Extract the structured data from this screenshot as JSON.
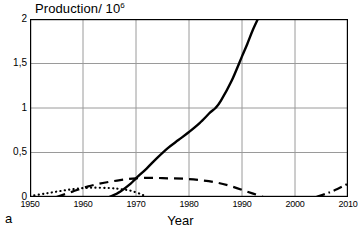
{
  "figure": {
    "panel_label": "a",
    "title": "Production/ 10",
    "title_superscript": "6",
    "xlabel": "Year"
  },
  "chart_data": {
    "type": "line",
    "xlabel": "Year",
    "ylabel": "Production/ 10^6",
    "xlim": [
      1950,
      2010
    ],
    "ylim": [
      0,
      2
    ],
    "grid": true,
    "legend": "none",
    "xticks": [
      1950,
      1960,
      1970,
      1980,
      1990,
      2000,
      2010
    ],
    "xtick_labels": [
      "1950",
      "1960",
      "1970",
      "1980",
      "1990",
      "2000",
      "2010"
    ],
    "yticks": [
      0,
      0.5,
      1,
      1.5,
      2
    ],
    "ytick_labels": [
      "0",
      "0,5",
      "1",
      "1,5",
      "2"
    ],
    "series": [
      {
        "name": "solid-curve",
        "style": "solid",
        "color": "#000000",
        "x": [
          1965,
          1967,
          1969,
          1970,
          1972,
          1974,
          1976,
          1978,
          1980,
          1982,
          1984,
          1985,
          1986,
          1988,
          1990,
          1991,
          1992,
          1993
        ],
        "values": [
          0.0,
          0.06,
          0.15,
          0.21,
          0.32,
          0.44,
          0.55,
          0.64,
          0.73,
          0.83,
          0.95,
          1.0,
          1.08,
          1.3,
          1.58,
          1.72,
          1.87,
          2.0
        ]
      },
      {
        "name": "dashed-curve",
        "style": "dashed",
        "color": "#000000",
        "x": [
          1955,
          1958,
          1961,
          1964,
          1967,
          1970,
          1973,
          1976,
          1979,
          1982,
          1985,
          1988,
          1991,
          1994
        ],
        "values": [
          0.0,
          0.06,
          0.12,
          0.16,
          0.19,
          0.21,
          0.215,
          0.21,
          0.205,
          0.19,
          0.165,
          0.12,
          0.06,
          0.0
        ]
      },
      {
        "name": "dotted-curve",
        "style": "dotted",
        "color": "#000000",
        "x": [
          1950,
          1953,
          1956,
          1959,
          1962,
          1965,
          1967,
          1969,
          1971,
          1972
        ],
        "values": [
          0.01,
          0.04,
          0.07,
          0.095,
          0.105,
          0.1,
          0.09,
          0.07,
          0.03,
          0.0
        ]
      },
      {
        "name": "dash-dot-curve",
        "style": "dashdot",
        "color": "#000000",
        "x": [
          2004,
          2006,
          2008,
          2010
        ],
        "values": [
          0.0,
          0.04,
          0.09,
          0.15
        ]
      }
    ]
  }
}
